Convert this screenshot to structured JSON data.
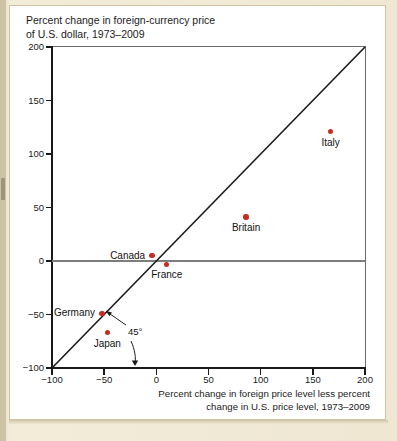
{
  "figure": {
    "title": "Percent change in foreign-currency price\nof U.S. dollar, 1973–2009",
    "xaxis_title": "Percent change in foreign price level less percent\nchange in U.S. price level, 1973–2009",
    "reference_line_label": "45°",
    "dot_color": "#c62d22",
    "line_color": "#1a1a1a",
    "background": "#ffffff",
    "page_background": "#efe8d2"
  },
  "chart_data": {
    "type": "scatter",
    "title": "Percent change in foreign-currency price of U.S. dollar, 1973–2009",
    "xlabel": "Percent change in foreign price level less percent change in U.S. price level, 1973–2009",
    "ylabel": "Percent change in foreign-currency price of U.S. dollar, 1973–2009",
    "xlim": [
      -100,
      200
    ],
    "ylim": [
      -100,
      200
    ],
    "xticks": [
      -100,
      -50,
      0,
      50,
      100,
      150,
      200
    ],
    "yticks": [
      -100,
      -50,
      0,
      50,
      100,
      150,
      200
    ],
    "xtick_labels": [
      "−100",
      "−50",
      "0",
      "50",
      "100",
      "150",
      "200"
    ],
    "ytick_labels": [
      "−100",
      "−50",
      "0",
      "50",
      "100",
      "150",
      "200"
    ],
    "grid": false,
    "legend": "none",
    "annotations": [
      {
        "text": "45°",
        "x": -28,
        "y": -75,
        "note": "label for the 45-degree reference line"
      }
    ],
    "reference_line": {
      "type": "identity",
      "label": "45°",
      "from": [
        -100,
        -100
      ],
      "to": [
        200,
        200
      ]
    },
    "points": [
      {
        "label": "Italy",
        "x": 167,
        "y": 121,
        "label_pos": "below"
      },
      {
        "label": "Britain",
        "x": 86,
        "y": 41,
        "label_pos": "below"
      },
      {
        "label": "Canada",
        "x": -4,
        "y": 5,
        "label_pos": "left"
      },
      {
        "label": "France",
        "x": 10,
        "y": -3,
        "label_pos": "below"
      },
      {
        "label": "Germany",
        "x": -52,
        "y": -49,
        "label_pos": "left"
      },
      {
        "label": "Japan",
        "x": -47,
        "y": -67,
        "label_pos": "below"
      }
    ]
  }
}
